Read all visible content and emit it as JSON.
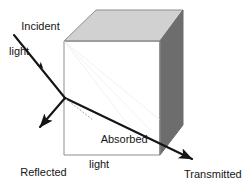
{
  "figure": {
    "width": 243,
    "height": 190,
    "background_color": "#ffffff"
  },
  "labels": {
    "incident": {
      "line1": "Incident",
      "line2": "light"
    },
    "reflected": {
      "line1": "Reflected",
      "line2": "light"
    },
    "absorbed": {
      "line1": "Absorbed",
      "line2": "light"
    },
    "transmitted": {
      "line1": "Transmitted",
      "line2": "light"
    }
  },
  "colors": {
    "stroke": "#151515",
    "cube_outline": "#8a8a8a",
    "cube_front_face": "#ffffff",
    "cube_top_face": "#d0d0d0",
    "cube_right_face": "#6e6e6e",
    "dotted_ray": "#9a9a9a",
    "text": "#151515"
  },
  "geometry": {
    "cube": {
      "front_face": "64,41 160,41 160,155 64,155",
      "top_face": "64,41 96,10 183,10 160,41",
      "right_face": "160,41 183,10 183,125 160,155"
    },
    "rays": {
      "incident": {
        "from": "14,35",
        "to": "65,98",
        "arrow_at": "40,65"
      },
      "reflected": {
        "from": "65,98",
        "to": "38,129",
        "arrow_at": "38,129"
      },
      "transmitted": {
        "from": "65,98",
        "to": "194,161",
        "arrow_at": "194,161"
      },
      "absorbed_dotted": {
        "from": "66,99",
        "to": "93,120"
      }
    }
  }
}
